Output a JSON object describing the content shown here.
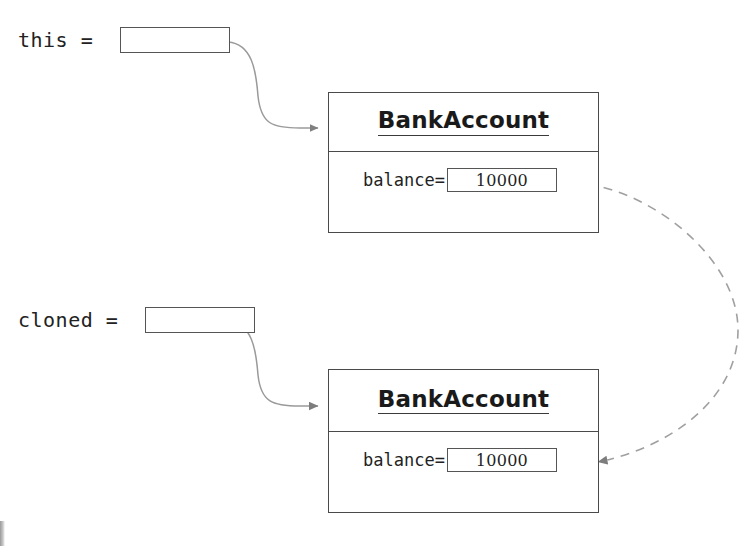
{
  "diagram": {
    "variables": [
      {
        "name": "this-variable",
        "label": "this = ",
        "value": ""
      },
      {
        "name": "cloned-variable",
        "label": "cloned = ",
        "value": ""
      }
    ],
    "objects": [
      {
        "name": "bank-account-original",
        "class_name": "BankAccount",
        "fields": [
          {
            "label": "balance=",
            "value": "10000"
          }
        ]
      },
      {
        "name": "bank-account-clone",
        "class_name": "BankAccount",
        "fields": [
          {
            "label": "balance=",
            "value": "10000"
          }
        ]
      }
    ],
    "connectors": [
      {
        "name": "this-to-original",
        "style": "solid",
        "from": "this-variable",
        "to": "bank-account-original"
      },
      {
        "name": "cloned-to-clone",
        "style": "solid",
        "from": "cloned-variable",
        "to": "bank-account-clone"
      },
      {
        "name": "copy-balance-value",
        "style": "dashed",
        "from": "original-balance-value",
        "to": "clone-balance-value"
      }
    ],
    "colors": {
      "ink": "#1a1a1a",
      "box_border": "#4a4a4a",
      "slot_border": "#555555",
      "connector": "#8a8a8a",
      "background": "#ffffff"
    }
  }
}
